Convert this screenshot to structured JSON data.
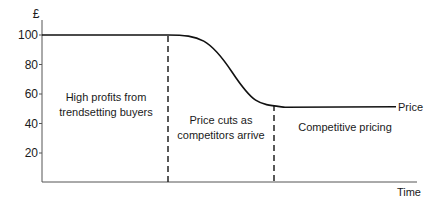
{
  "chart_data": {
    "type": "line",
    "title": "",
    "xlabel": "Time",
    "ylabel": "£",
    "ylim": [
      0,
      105
    ],
    "xlim": [
      0,
      10
    ],
    "y_ticks": [
      {
        "value": 100,
        "label": "100"
      },
      {
        "value": 80,
        "label": "80"
      },
      {
        "value": 60,
        "label": "60"
      },
      {
        "value": 40,
        "label": "40"
      },
      {
        "value": 20,
        "label": "20"
      }
    ],
    "grid": false,
    "series": [
      {
        "name": "Price",
        "label": "Price",
        "x": [
          0,
          3.3,
          4.0,
          4.8,
          5.6,
          6.3,
          7.0,
          8.5,
          9.4
        ],
        "y": [
          100,
          100,
          98,
          88,
          72,
          59,
          52,
          51,
          51
        ]
      }
    ],
    "dividers": [
      {
        "x": 3.3,
        "style": "dashed"
      },
      {
        "x": 6.3,
        "style": "dashed"
      }
    ],
    "regions": [
      {
        "lines": [
          "High profits from",
          "trendsetting buyers"
        ],
        "x_center": 1.6,
        "y_center": 47
      },
      {
        "lines": [
          "Price cuts as",
          "competitors arrive"
        ],
        "x_center": 4.8,
        "y_center": 40
      },
      {
        "lines": [
          "Competitive pricing"
        ],
        "x_center": 7.85,
        "y_center": 40
      }
    ]
  }
}
